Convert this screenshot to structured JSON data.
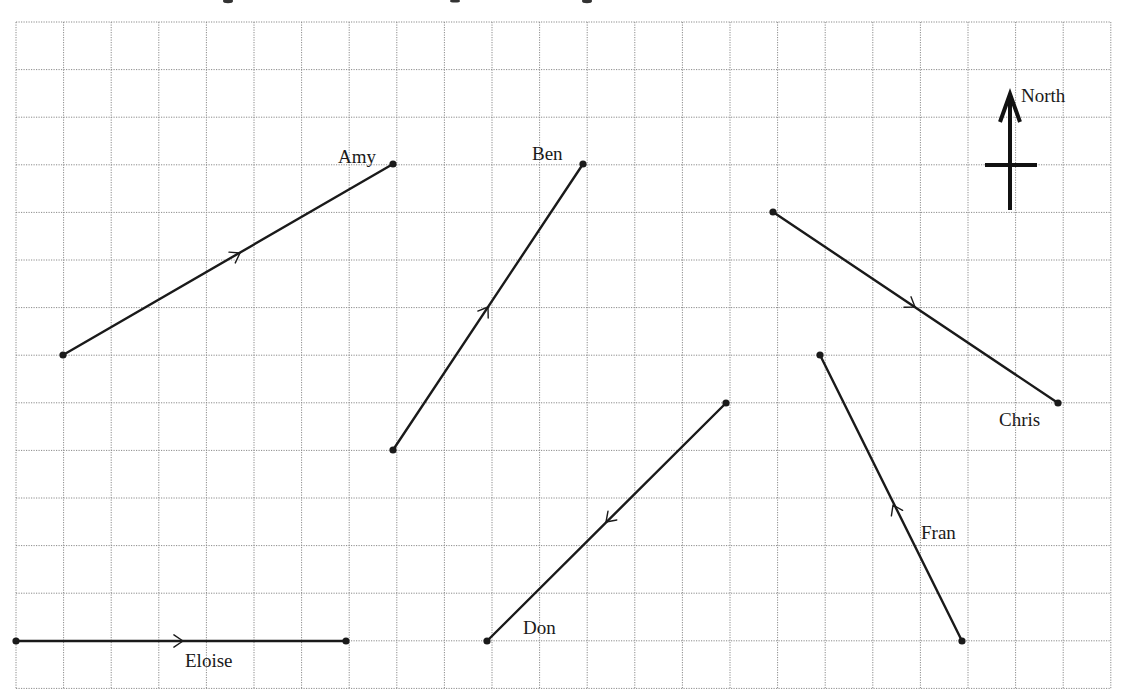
{
  "diagram": {
    "grid": {
      "origin_x": 16,
      "origin_y": 22,
      "cell_size": 47.6,
      "columns": 23,
      "rows": 14,
      "line_style": "dotted",
      "line_color": "#8a8a8a"
    },
    "compass": {
      "label": "North",
      "icon": "north-arrow-icon",
      "shaft": {
        "x": 1010,
        "y_top": 92,
        "y_bottom": 210
      },
      "crossbar": {
        "y": 165,
        "x_left": 985,
        "x_right": 1037
      },
      "label_pos": {
        "x": 1021,
        "y": 102
      }
    },
    "journeys": [
      {
        "name": "Amy",
        "start": {
          "col": 1,
          "row": 7
        },
        "end": {
          "col": 8,
          "row": 3
        },
        "start_px": [
          63,
          355
        ],
        "end_px": [
          393,
          164
        ],
        "arrow_px": [
          240,
          253
        ],
        "direction": "toward end",
        "label_px": [
          338,
          163
        ]
      },
      {
        "name": "Ben",
        "start": {
          "col": 8,
          "row": 9
        },
        "end": {
          "col": 12,
          "row": 3
        },
        "start_px": [
          393,
          450
        ],
        "end_px": [
          583,
          164
        ],
        "arrow_px": [
          488,
          307
        ],
        "direction": "toward end",
        "label_px": [
          532,
          160
        ]
      },
      {
        "name": "Chris",
        "start": {
          "col": 16,
          "row": 4
        },
        "end": {
          "col": 22,
          "row": 8
        },
        "start_px": [
          773,
          212
        ],
        "end_px": [
          1058,
          403
        ],
        "arrow_px": [
          915,
          307
        ],
        "direction": "toward end",
        "label_px": [
          999,
          426
        ]
      },
      {
        "name": "Don",
        "start": {
          "col": 15,
          "row": 8
        },
        "end": {
          "col": 10,
          "row": 13
        },
        "start_px": [
          726,
          403
        ],
        "end_px": [
          487,
          641
        ],
        "arrow_px": [
          606,
          522
        ],
        "direction": "toward end",
        "label_px": [
          523,
          634
        ]
      },
      {
        "name": "Eloise",
        "start": {
          "col": 0,
          "row": 13
        },
        "end": {
          "col": 7,
          "row": 13
        },
        "start_px": [
          16,
          641
        ],
        "end_px": [
          346,
          641
        ],
        "arrow_px": [
          183,
          641
        ],
        "direction": "toward end",
        "label_px": [
          185,
          667
        ]
      },
      {
        "name": "Fran",
        "start": {
          "col": 20,
          "row": 13
        },
        "end": {
          "col": 17,
          "row": 7
        },
        "start_px": [
          962,
          641
        ],
        "end_px": [
          820,
          355
        ],
        "arrow_px": [
          893,
          505
        ],
        "direction": "toward end",
        "label_px": [
          921,
          539
        ]
      }
    ]
  }
}
